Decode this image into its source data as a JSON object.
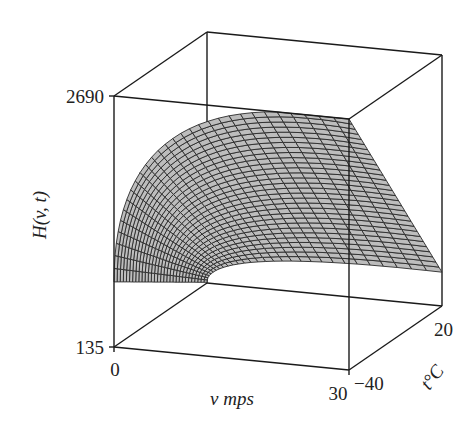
{
  "chart_data": {
    "type": "surface3d",
    "title": "",
    "xlabel": "v mps",
    "ylabel": "t°C",
    "zlabel": "H(v, t)",
    "x_ticks": [
      "0",
      "30"
    ],
    "y_ticks": [
      "−40",
      "20"
    ],
    "z_ticks": [
      "135",
      "2690"
    ],
    "xlim": [
      0,
      30
    ],
    "ylim": [
      -40,
      20
    ],
    "zlim": [
      135,
      2690
    ],
    "grid": false,
    "box": true,
    "surface_model": "H = 1.046 * (10.45 + 10*sqrt(v) - v) * (33 - t)",
    "sample_points": [
      {
        "v": 0,
        "t": -40,
        "H": 798
      },
      {
        "v": 0,
        "t": 20,
        "H": 142
      },
      {
        "v": 30,
        "t": -40,
        "H": 2690
      },
      {
        "v": 30,
        "t": 20,
        "H": 481
      },
      {
        "v": 10,
        "t": -40,
        "H": 2455
      },
      {
        "v": 20,
        "t": -40,
        "H": 2655
      }
    ],
    "mesh": {
      "v_steps": 30,
      "t_steps": 30
    },
    "colors": {
      "surface": "#bdbdbd",
      "mesh": "#2a2a2a",
      "box": "#1a1a1a"
    }
  },
  "labels": {
    "z_max": "2690",
    "z_min": "135",
    "x_min": "0",
    "x_max": "30",
    "y_min": "−40",
    "y_max": "20",
    "x_title": "v mps",
    "y_title": "t°C",
    "z_title": "H(v, t)"
  }
}
